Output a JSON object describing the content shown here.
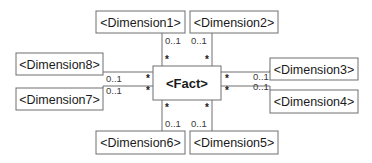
{
  "fact": {
    "label": "<Fact>"
  },
  "dimensions": [
    {
      "id": "dim1",
      "label": "<Dimension1>",
      "fact_multiplicity": "*",
      "dim_multiplicity": "0..1",
      "side": "top"
    },
    {
      "id": "dim2",
      "label": "<Dimension2>",
      "fact_multiplicity": "*",
      "dim_multiplicity": "0..1",
      "side": "top"
    },
    {
      "id": "dim3",
      "label": "<Dimension3>",
      "fact_multiplicity": "*",
      "dim_multiplicity": "0..1",
      "side": "right"
    },
    {
      "id": "dim4",
      "label": "<Dimension4>",
      "fact_multiplicity": "*",
      "dim_multiplicity": "0..1",
      "side": "right"
    },
    {
      "id": "dim5",
      "label": "<Dimension5>",
      "fact_multiplicity": "*",
      "dim_multiplicity": "0..1",
      "side": "bottom"
    },
    {
      "id": "dim6",
      "label": "<Dimension6>",
      "fact_multiplicity": "*",
      "dim_multiplicity": "0..1",
      "side": "bottom"
    },
    {
      "id": "dim7",
      "label": "<Dimension7>",
      "fact_multiplicity": "*",
      "dim_multiplicity": "0..1",
      "side": "left"
    },
    {
      "id": "dim8",
      "label": "<Dimension8>",
      "fact_multiplicity": "*",
      "dim_multiplicity": "0..1",
      "side": "left"
    }
  ]
}
